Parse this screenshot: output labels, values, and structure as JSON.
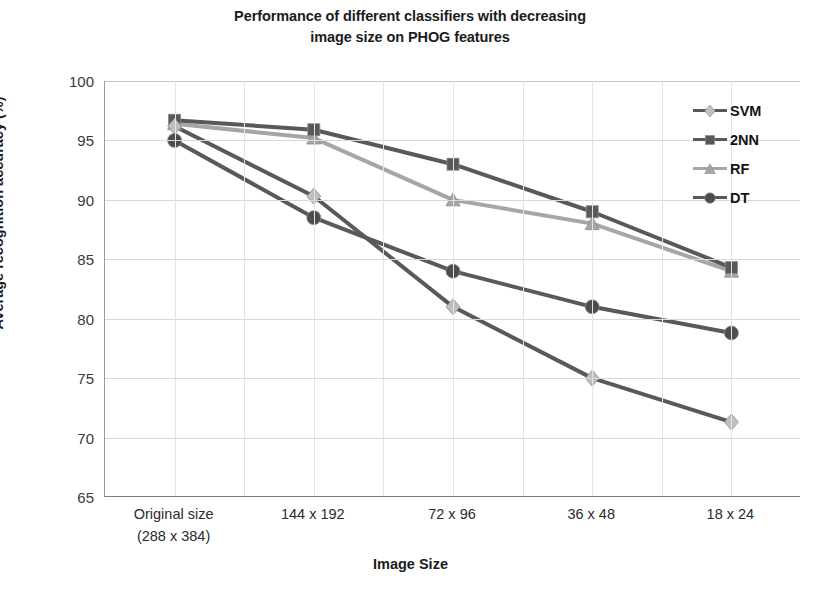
{
  "chart_data": {
    "type": "line",
    "title": "Performance of different classifiers with decreasing image size on PHOG features",
    "title_line1": "Performance of different classifiers with decreasing",
    "title_line2": "image size on PHOG features",
    "xlabel": "Image Size",
    "ylabel": "Average recognition accuracy (%)",
    "categories": [
      "Original size\n(288 x 384)",
      "144 x 192",
      "72 x 96",
      "36 x 48",
      "18 x 24"
    ],
    "category_lines": [
      [
        "Original size",
        "(288 x 384)"
      ],
      [
        "144 x 192",
        ""
      ],
      [
        "72 x 96",
        ""
      ],
      [
        "36 x 48",
        ""
      ],
      [
        "18 x 24",
        ""
      ]
    ],
    "ylim": [
      65,
      100
    ],
    "yticks": [
      100,
      95,
      90,
      85,
      80,
      75,
      70,
      65
    ],
    "ytick_labels": [
      "100",
      "95",
      "90",
      "85",
      "80",
      "75",
      "70",
      "65"
    ],
    "grid": true,
    "legend_position": "top-right",
    "series": [
      {
        "name": "SVM",
        "marker": "diamond",
        "line_color": "#595959",
        "marker_color": "#bfbfbf",
        "values": [
          96.2,
          90.3,
          81.0,
          75.0,
          71.3
        ]
      },
      {
        "name": "2NN",
        "marker": "square",
        "line_color": "#595959",
        "marker_color": "#595959",
        "values": [
          96.7,
          95.9,
          93.0,
          89.0,
          84.3
        ]
      },
      {
        "name": "RF",
        "marker": "triangle",
        "line_color": "#a6a6a6",
        "marker_color": "#a6a6a6",
        "values": [
          96.4,
          95.2,
          90.0,
          88.0,
          84.0
        ]
      },
      {
        "name": "DT",
        "marker": "circle",
        "line_color": "#595959",
        "marker_color": "#4d4d4d",
        "values": [
          95.0,
          88.5,
          84.0,
          81.0,
          78.8
        ]
      }
    ]
  }
}
